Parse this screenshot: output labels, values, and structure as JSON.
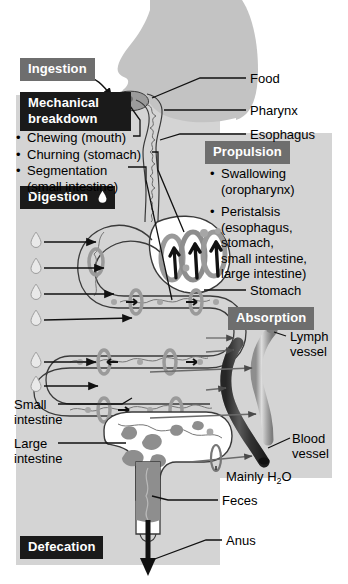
{
  "figure": {
    "colors": {
      "panel_background": "#d4d4d4",
      "header_black": "#1a1a1a",
      "header_gray": "#6e6e6e",
      "header_text": "#ffffff",
      "body_silhouette": "#c0c0c0",
      "tract_fill": "#ffffff",
      "tract_outline": "#3a3a3a",
      "blood_vessel": "#4a4a4a",
      "lymph_vessel": "#a8a8a8",
      "feces": "#8c8c8c",
      "page_background": "#ffffff"
    }
  },
  "sections": {
    "ingestion": {
      "label": "Ingestion",
      "style": "gray"
    },
    "mechanical": {
      "label": "Mechanical breakdown",
      "label_line1": "Mechanical",
      "label_line2": "breakdown",
      "style": "black"
    },
    "digestion": {
      "label": "Digestion",
      "style": "black",
      "icon": "droplet-icon"
    },
    "propulsion": {
      "label": "Propulsion",
      "style": "gray"
    },
    "absorption": {
      "label": "Absorption",
      "style": "gray"
    },
    "defecation": {
      "label": "Defecation",
      "style": "black"
    }
  },
  "mechanical_items": [
    {
      "bullet": "•",
      "text": "Chewing (mouth)"
    },
    {
      "bullet": "•",
      "text": "Churning (stomach)"
    },
    {
      "bullet": "•",
      "text": "Segmentation",
      "cont": "(small intestine)"
    }
  ],
  "propulsion_items": [
    {
      "bullet": "•",
      "text": "Swallowing",
      "cont": "(oropharynx)"
    },
    {
      "bullet": "•",
      "text": "Peristalsis",
      "cont": "(esophagus,",
      "cont2": "stomach,",
      "cont3": "small intestine,",
      "cont4": "large intestine)"
    }
  ],
  "labels": {
    "food": "Food",
    "pharynx": "Pharynx",
    "esophagus": "Esophagus",
    "stomach": "Stomach",
    "lymph_vessel_line1": "Lymph",
    "lymph_vessel_line2": "vessel",
    "blood_vessel_line1": "Blood",
    "blood_vessel_line2": "vessel",
    "mainly_water_pre": "Mainly H",
    "mainly_water_sub": "2",
    "mainly_water_post": "O",
    "feces": "Feces",
    "anus": "Anus",
    "small_intestine_line1": "Small",
    "small_intestine_line2": "intestine",
    "large_intestine_line1": "Large",
    "large_intestine_line2": "intestine"
  }
}
